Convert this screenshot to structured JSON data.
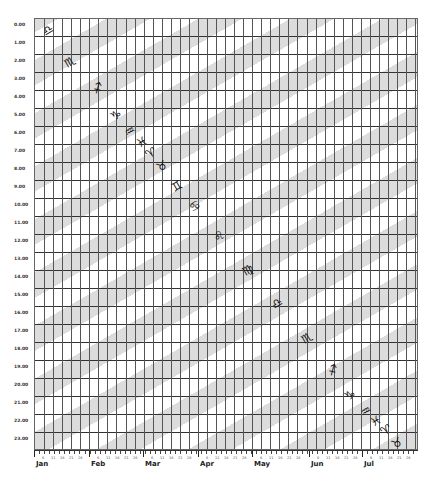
{
  "chart_data": {
    "type": "heatmap",
    "title": "",
    "xlabel": "",
    "ylabel": "",
    "y_ticks": [
      "0.00",
      "1.00",
      "2.00",
      "3.00",
      "4.00",
      "5.00",
      "6.00",
      "7.00",
      "8.00",
      "9.00",
      "10.00",
      "11.00",
      "12.00",
      "13.00",
      "14.00",
      "15.00",
      "16.00",
      "17.00",
      "18.00",
      "19.00",
      "20.00",
      "21.00",
      "22.00",
      "23.00"
    ],
    "x_months": [
      "Jan",
      "Feb",
      "Mar",
      "Apr",
      "May",
      "Jun",
      "Jul"
    ],
    "x_day_ticks": [
      "1",
      "6",
      "11",
      "16",
      "21",
      "26"
    ],
    "ylim": [
      0,
      24
    ],
    "grid": true,
    "band_color": "#dcdcdc",
    "zodiac_markers": [
      {
        "sign": "Libra",
        "glyph": "♎",
        "x": 48,
        "y": 30
      },
      {
        "sign": "Scorpio",
        "glyph": "♏",
        "x": 70,
        "y": 62
      },
      {
        "sign": "Sagittarius",
        "glyph": "♐",
        "x": 98,
        "y": 88
      },
      {
        "sign": "Capricorn",
        "glyph": "♑",
        "x": 116,
        "y": 115
      },
      {
        "sign": "Aquarius",
        "glyph": "♒",
        "x": 130,
        "y": 131
      },
      {
        "sign": "Pisces",
        "glyph": "♓",
        "x": 142,
        "y": 142
      },
      {
        "sign": "Aries",
        "glyph": "♈",
        "x": 151,
        "y": 153
      },
      {
        "sign": "Taurus",
        "glyph": "♉",
        "x": 162,
        "y": 166
      },
      {
        "sign": "Gemini",
        "glyph": "♊",
        "x": 177,
        "y": 186
      },
      {
        "sign": "Cancer",
        "glyph": "♋",
        "x": 195,
        "y": 206
      },
      {
        "sign": "Leo",
        "glyph": "♌",
        "x": 219,
        "y": 236
      },
      {
        "sign": "Virgo",
        "glyph": "♍",
        "x": 248,
        "y": 270
      },
      {
        "sign": "Libra",
        "glyph": "♎",
        "x": 277,
        "y": 303
      },
      {
        "sign": "Scorpio",
        "glyph": "♏",
        "x": 307,
        "y": 338
      },
      {
        "sign": "Sagittarius",
        "glyph": "♐",
        "x": 333,
        "y": 370
      },
      {
        "sign": "Capricorn",
        "glyph": "♑",
        "x": 350,
        "y": 395
      },
      {
        "sign": "Aquarius",
        "glyph": "♒",
        "x": 366,
        "y": 411
      },
      {
        "sign": "Pisces",
        "glyph": "♓",
        "x": 376,
        "y": 421
      },
      {
        "sign": "Aries",
        "glyph": "♈",
        "x": 386,
        "y": 430
      },
      {
        "sign": "Taurus",
        "glyph": "♉",
        "x": 397,
        "y": 443
      }
    ]
  }
}
